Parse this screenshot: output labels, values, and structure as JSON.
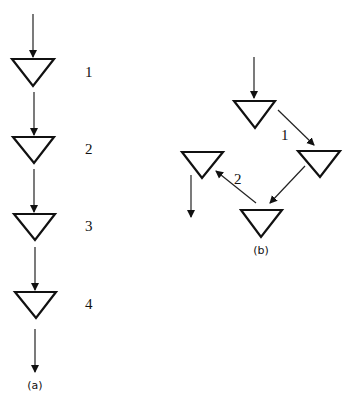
{
  "diagram": {
    "panel_a": {
      "caption": "(a)",
      "labels": [
        "1",
        "2",
        "3",
        "4"
      ],
      "description": "Four triangles arranged in a vertical chain connected by downward arrows"
    },
    "panel_b": {
      "caption": "(b)",
      "labels": [
        "1",
        "2"
      ],
      "description": "Four triangles arranged in a diamond/cycle: top -> right (1) -> bottom -> left (2) -> down"
    },
    "colors": {
      "stroke": "#111111",
      "background": "#ffffff"
    }
  }
}
